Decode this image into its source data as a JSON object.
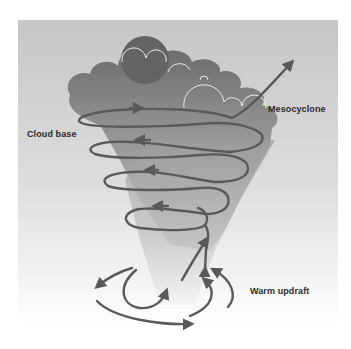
{
  "diagram": {
    "labels": {
      "cloud_base": "Cloud base",
      "mesocyclone": "Mesocyclone",
      "warm_updraft": "Warm updraft"
    },
    "colors": {
      "background_top": "#c8c8c8",
      "background_bottom": "#ffffff",
      "cloud_dark": "#6e6e6e",
      "cloud_light": "#bdbdbd",
      "funnel": "#a8a8a8",
      "arrow": "#5a5a5a",
      "text": "#2a2a2a"
    }
  }
}
